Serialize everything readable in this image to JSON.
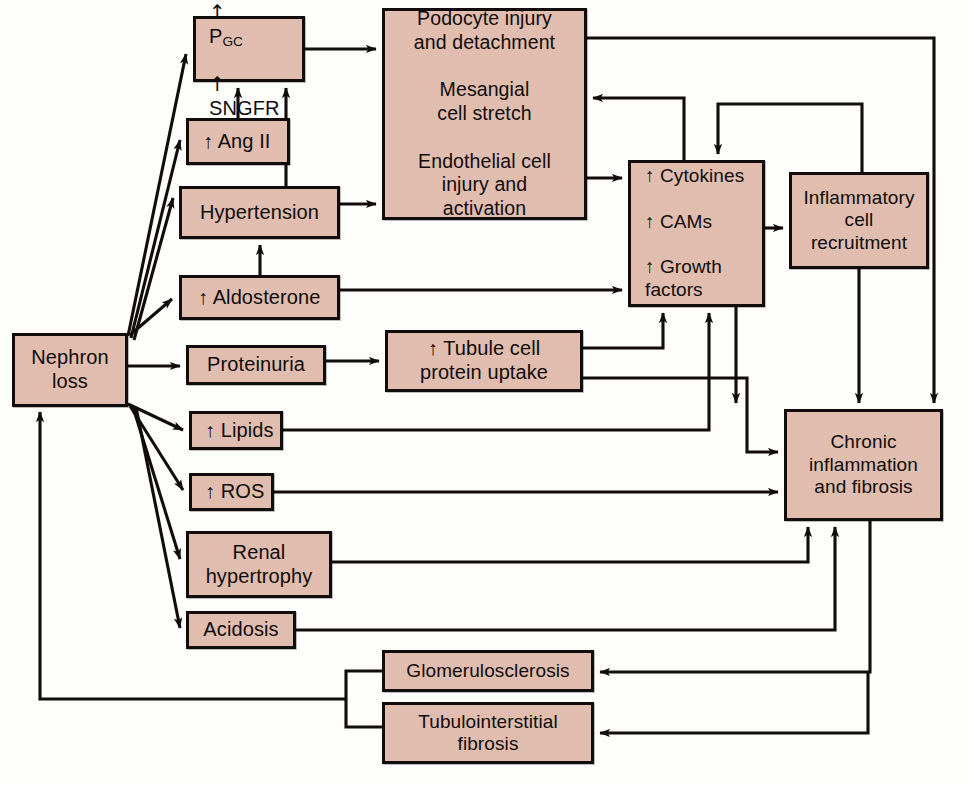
{
  "diagram": {
    "box_fill": "#e0bdae",
    "box_stroke": "#120d0a",
    "background": "#fdfdfc",
    "arrow_up": "↑"
  },
  "nodes": {
    "nephron_loss": {
      "label": "Nephron\nloss",
      "x": 12,
      "y": 333,
      "w": 116,
      "h": 74
    },
    "pgc_sngfr": {
      "label": "P",
      "line1_sub": "GC",
      "line2": "SNGFR",
      "x": 193,
      "y": 16,
      "w": 112,
      "h": 66
    },
    "ang_ii": {
      "label": "↑ Ang II",
      "x": 186,
      "y": 118,
      "w": 104,
      "h": 47
    },
    "hypertension": {
      "label": "Hypertension",
      "x": 179,
      "y": 186,
      "w": 161,
      "h": 53
    },
    "aldosterone": {
      "label": "↑ Aldosterone",
      "x": 179,
      "y": 275,
      "w": 161,
      "h": 45
    },
    "proteinuria": {
      "label": "Proteinuria",
      "x": 186,
      "y": 345,
      "w": 140,
      "h": 40
    },
    "lipids": {
      "label": "↑ Lipids",
      "x": 189,
      "y": 411,
      "w": 94,
      "h": 39
    },
    "ros": {
      "label": "↑ ROS",
      "x": 189,
      "y": 473,
      "w": 85,
      "h": 38
    },
    "renal_hypertrophy": {
      "label": "Renal\nhypertrophy",
      "x": 186,
      "y": 531,
      "w": 146,
      "h": 67
    },
    "acidosis": {
      "label": "Acidosis",
      "x": 186,
      "y": 611,
      "w": 110,
      "h": 38
    },
    "podocyte": {
      "label": "Podocyte injury\nand detachment\n\nMesangial\ncell stretch\n\nEndothelial cell\ninjury and\nactivation",
      "x": 382,
      "y": 8,
      "w": 205,
      "h": 212
    },
    "tubule_uptake": {
      "label": "↑ Tubule cell\nprotein uptake",
      "x": 385,
      "y": 330,
      "w": 198,
      "h": 62
    },
    "cytokines": {
      "label": "↑ Cytokines\n\n↑ CAMs\n\n↑ Growth\nfactors",
      "x": 628,
      "y": 160,
      "w": 137,
      "h": 147
    },
    "inflammatory": {
      "label": "Inflammatory\ncell\nrecruitment",
      "x": 789,
      "y": 172,
      "w": 140,
      "h": 97
    },
    "chronic": {
      "label": "Chronic\ninflammation\nand fibrosis",
      "x": 784,
      "y": 409,
      "w": 159,
      "h": 112
    },
    "glomerulosclerosis": {
      "label": "Glomerulosclerosis",
      "x": 382,
      "y": 650,
      "w": 212,
      "h": 42
    },
    "tubulointerstitial": {
      "label": "Tubulointerstitial\nfibrosis",
      "x": 382,
      "y": 702,
      "w": 212,
      "h": 62
    }
  },
  "edges": [
    {
      "from": "nephron_loss",
      "to": "pgc_sngfr",
      "kind": "diagonal"
    },
    {
      "from": "nephron_loss",
      "to": "ang_ii",
      "kind": "diagonal"
    },
    {
      "from": "nephron_loss",
      "to": "hypertension",
      "kind": "diagonal"
    },
    {
      "from": "nephron_loss",
      "to": "aldosterone",
      "kind": "diagonal"
    },
    {
      "from": "nephron_loss",
      "to": "proteinuria",
      "kind": "straight"
    },
    {
      "from": "nephron_loss",
      "to": "lipids",
      "kind": "diagonal"
    },
    {
      "from": "nephron_loss",
      "to": "ros",
      "kind": "diagonal"
    },
    {
      "from": "nephron_loss",
      "to": "renal_hypertrophy",
      "kind": "diagonal"
    },
    {
      "from": "nephron_loss",
      "to": "acidosis",
      "kind": "diagonal"
    },
    {
      "from": "ang_ii",
      "to": "pgc_sngfr",
      "kind": "up"
    },
    {
      "from": "hypertension",
      "to": "pgc_sngfr",
      "kind": "up"
    },
    {
      "from": "aldosterone",
      "to": "hypertension",
      "kind": "up"
    },
    {
      "from": "pgc_sngfr",
      "to": "podocyte",
      "kind": "straight"
    },
    {
      "from": "hypertension",
      "to": "podocyte",
      "kind": "straight"
    },
    {
      "from": "podocyte",
      "to": "cytokines",
      "kind": "straight"
    },
    {
      "from": "podocyte",
      "to": "chronic",
      "kind": "orthogonal"
    },
    {
      "from": "aldosterone",
      "to": "cytokines",
      "kind": "straight"
    },
    {
      "from": "proteinuria",
      "to": "tubule_uptake",
      "kind": "straight"
    },
    {
      "from": "tubule_uptake",
      "to": "cytokines",
      "kind": "orthogonal"
    },
    {
      "from": "tubule_uptake",
      "to": "chronic",
      "kind": "orthogonal"
    },
    {
      "from": "lipids",
      "to": "cytokines",
      "kind": "orthogonal"
    },
    {
      "from": "ros",
      "to": "chronic",
      "kind": "straight"
    },
    {
      "from": "renal_hypertrophy",
      "to": "chronic",
      "kind": "orthogonal"
    },
    {
      "from": "acidosis",
      "to": "chronic",
      "kind": "orthogonal"
    },
    {
      "from": "cytokines",
      "to": "inflammatory",
      "kind": "straight"
    },
    {
      "from": "cytokines",
      "to": "podocyte",
      "kind": "orthogonal"
    },
    {
      "from": "cytokines",
      "to": "chronic",
      "kind": "orthogonal"
    },
    {
      "from": "inflammatory",
      "to": "podocyte",
      "kind": "orthogonal"
    },
    {
      "from": "inflammatory",
      "to": "cytokines",
      "kind": "orthogonal"
    },
    {
      "from": "inflammatory",
      "to": "chronic",
      "kind": "straight"
    },
    {
      "from": "chronic",
      "to": "glomerulosclerosis",
      "kind": "orthogonal"
    },
    {
      "from": "chronic",
      "to": "tubulointerstitial",
      "kind": "orthogonal"
    },
    {
      "from": "glomerulosclerosis",
      "to": "nephron_loss",
      "kind": "orthogonal"
    },
    {
      "from": "tubulointerstitial",
      "to": "nephron_loss",
      "kind": "orthogonal"
    }
  ]
}
